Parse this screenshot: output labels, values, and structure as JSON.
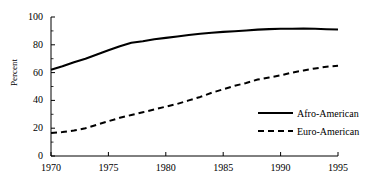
{
  "chart_data": {
    "type": "line",
    "title": "",
    "xlabel": "",
    "ylabel": "Percent",
    "xlim": [
      1970,
      1995
    ],
    "ylim": [
      0,
      100
    ],
    "xticks": [
      "1970",
      "1975",
      "1980",
      "1985",
      "1990",
      "1995"
    ],
    "yticks": [
      "0",
      "20",
      "40",
      "60",
      "80",
      "100"
    ],
    "minor_yticks": true,
    "grid": false,
    "legend_position": "center-right",
    "x": [
      1970,
      1971,
      1972,
      1973,
      1974,
      1975,
      1976,
      1977,
      1978,
      1979,
      1980,
      1981,
      1982,
      1983,
      1984,
      1985,
      1986,
      1987,
      1988,
      1989,
      1990,
      1991,
      1992,
      1993,
      1994,
      1995
    ],
    "series": [
      {
        "name": "Afro-American",
        "style": "solid",
        "color": "#000000",
        "values": [
          62.0,
          64.5,
          67.5,
          70.0,
          73.0,
          76.0,
          79.0,
          81.5,
          82.5,
          84.0,
          85.0,
          86.0,
          87.0,
          88.0,
          88.7,
          89.3,
          89.8,
          90.3,
          90.9,
          91.3,
          91.5,
          91.6,
          91.7,
          91.5,
          91.2,
          91.0
        ]
      },
      {
        "name": "Euro-American",
        "style": "dashed",
        "color": "#000000",
        "values": [
          16.5,
          17.2,
          18.3,
          20.0,
          22.5,
          25.0,
          27.5,
          29.5,
          31.5,
          33.5,
          35.5,
          37.5,
          40.0,
          42.5,
          45.5,
          48.0,
          50.5,
          52.5,
          55.0,
          56.5,
          58.0,
          60.0,
          61.5,
          63.0,
          64.2,
          65.0
        ]
      }
    ]
  },
  "legend": {
    "items": [
      {
        "label": "Afro-American",
        "style": "solid"
      },
      {
        "label": "Euro-American",
        "style": "dashed"
      }
    ]
  }
}
